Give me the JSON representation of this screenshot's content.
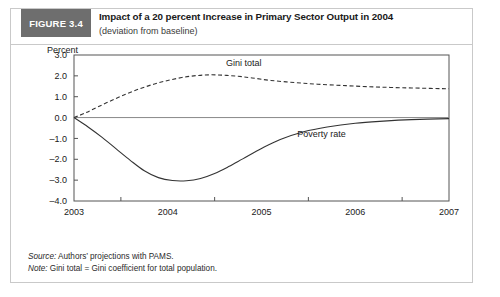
{
  "figure": {
    "badge_label": "FIGURE 3.4",
    "title": "Impact of a 20 percent Increase in Primary Sector Output in 2004",
    "subtitle": "(deviation from baseline)",
    "badge_color": "#6e6e6e",
    "frame_color": "#c9c9c9"
  },
  "footnotes": {
    "source_lead": "Source:",
    "source_text": " Authors’ projections with PAMS.",
    "note_lead": "Note:",
    "note_text": " Gini total = Gini coefficient for total population."
  },
  "chart_data": {
    "type": "line",
    "title": "Impact of a 20 percent Increase in Primary Sector Output in 2004",
    "subtitle": "(deviation from baseline)",
    "xlabel": "",
    "ylabel": "Percent",
    "ylim": [
      -4.0,
      3.0
    ],
    "xlim": [
      2003,
      2007
    ],
    "grid": false,
    "zero_line": true,
    "legend": "inline-annotations",
    "ytick_labels": [
      "3.0",
      "2.0",
      "1.0",
      "0.0",
      "–1.0",
      "–2.0",
      "–3.0",
      "–4.0"
    ],
    "ytick_values": [
      3.0,
      2.0,
      1.0,
      0.0,
      -1.0,
      -2.0,
      -3.0,
      -4.0
    ],
    "xtick_labels": [
      "2003",
      "2004",
      "2005",
      "2006",
      "2007"
    ],
    "xtick_values": [
      2003,
      2004,
      2005,
      2006,
      2007
    ],
    "series": [
      {
        "name": "Gini total",
        "style": "dashed",
        "color": "#333333",
        "label_x": 2004.62,
        "label_y": 2.45,
        "x": [
          2003.0,
          2003.12,
          2003.25,
          2003.4,
          2003.55,
          2003.7,
          2003.85,
          2004.0,
          2004.15,
          2004.3,
          2004.45,
          2004.6,
          2004.75,
          2004.9,
          2005.1,
          2005.35,
          2005.6,
          2005.9,
          2006.2,
          2006.5,
          2006.8,
          2007.0
        ],
        "values": [
          0.0,
          0.22,
          0.5,
          0.82,
          1.12,
          1.38,
          1.6,
          1.78,
          1.92,
          2.01,
          2.05,
          2.03,
          1.98,
          1.9,
          1.78,
          1.68,
          1.6,
          1.53,
          1.47,
          1.43,
          1.4,
          1.38
        ]
      },
      {
        "name": "Poverty rate",
        "style": "solid",
        "color": "#333333",
        "label_x": 2005.38,
        "label_y": -0.95,
        "x": [
          2003.0,
          2003.15,
          2003.3,
          2003.45,
          2003.6,
          2003.75,
          2003.9,
          2004.05,
          2004.2,
          2004.35,
          2004.5,
          2004.65,
          2004.8,
          2005.0,
          2005.2,
          2005.45,
          2005.7,
          2006.0,
          2006.3,
          2006.6,
          2007.0
        ],
        "values": [
          0.0,
          -0.45,
          -0.95,
          -1.5,
          -2.05,
          -2.55,
          -2.88,
          -3.02,
          -3.03,
          -2.92,
          -2.68,
          -2.35,
          -1.98,
          -1.48,
          -1.05,
          -0.68,
          -0.45,
          -0.27,
          -0.17,
          -0.1,
          -0.05
        ]
      }
    ]
  }
}
